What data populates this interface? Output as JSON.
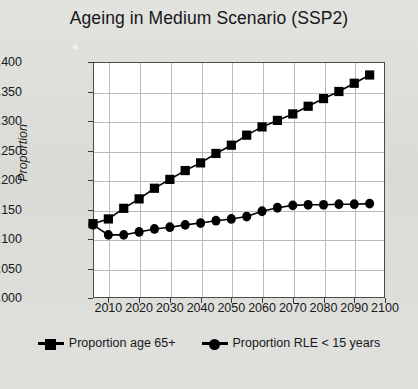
{
  "chart_data": {
    "type": "line",
    "title": "Ageing in Medium Scenario (SSP2)",
    "xlabel": "",
    "ylabel": "Proportion",
    "xlim": [
      2005,
      2100
    ],
    "ylim": [
      0.0,
      0.4
    ],
    "grid": true,
    "legend_position": "bottom",
    "ytick_labels": [
      "0.000",
      "0.050",
      "0.100",
      "0.150",
      "0.200",
      "0.250",
      "0.300",
      "0.350",
      "0.400"
    ],
    "ytick_values": [
      0.0,
      0.05,
      0.1,
      0.15,
      0.2,
      0.25,
      0.3,
      0.35,
      0.4
    ],
    "xtick_labels": [
      "2010",
      "2020",
      "2030",
      "2040",
      "2050",
      "2060",
      "2070",
      "2080",
      "2090",
      "2100"
    ],
    "xtick_values": [
      2010,
      2020,
      2030,
      2040,
      2050,
      2060,
      2070,
      2080,
      2090,
      2100
    ],
    "x": [
      2005,
      2010,
      2015,
      2020,
      2025,
      2030,
      2035,
      2040,
      2045,
      2050,
      2055,
      2060,
      2065,
      2070,
      2075,
      2080,
      2085,
      2090,
      2095
    ],
    "series": [
      {
        "name": "Proportion age 65+",
        "marker": "square",
        "color": "#000000",
        "values": [
          0.126,
          0.134,
          0.152,
          0.168,
          0.186,
          0.201,
          0.216,
          0.229,
          0.245,
          0.259,
          0.276,
          0.29,
          0.301,
          0.312,
          0.325,
          0.338,
          0.35,
          0.364,
          0.378
        ]
      },
      {
        "name": "Proportion RLE < 15 years",
        "marker": "circle",
        "color": "#000000",
        "values": [
          0.124,
          0.107,
          0.107,
          0.112,
          0.117,
          0.12,
          0.124,
          0.127,
          0.131,
          0.134,
          0.138,
          0.147,
          0.153,
          0.157,
          0.158,
          0.158,
          0.159,
          0.159,
          0.16
        ]
      }
    ]
  },
  "legend": {
    "items": [
      {
        "label": "Proportion age 65+",
        "marker": "square"
      },
      {
        "label": "Proportion RLE < 15 years",
        "marker": "circle"
      }
    ]
  }
}
